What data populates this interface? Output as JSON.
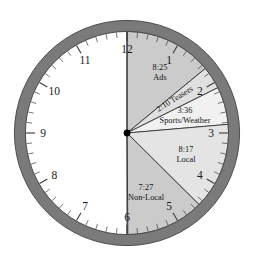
{
  "figure": {
    "name": "clock-pie-chart",
    "title": "",
    "face_background": "#ffffff",
    "bezel_color": "#7a7a7a",
    "bezel_edge_color": "#4a4a4a",
    "tick_color": "#3a3a3a",
    "line_color": "#000000",
    "hub_color": "#000000"
  },
  "clock": {
    "numerals": [
      "1",
      "2",
      "3",
      "4",
      "5",
      "6",
      "7",
      "8",
      "9",
      "10",
      "11",
      "12"
    ],
    "minute_ticks": 60,
    "center": {
      "x": 127,
      "y": 133
    },
    "radius": 113
  },
  "chart_data": {
    "type": "pie",
    "title": "",
    "subtitle": "",
    "xlabel": "",
    "ylabel": "",
    "units": "minutes:seconds",
    "total_label": "30:00",
    "total_minutes": 30,
    "start_angle_deg": 0,
    "direction": "clockwise",
    "legend": "inline-labels",
    "grid": false,
    "categories": [
      "Ads",
      "Teasers",
      "Sports/Weather",
      "Local",
      "Non-Local",
      "Unshaded"
    ],
    "values": [
      8.4167,
      2.1667,
      3.6,
      8.2833,
      7.45,
      0.0
    ],
    "slices": [
      {
        "name": "Ads",
        "time_label": "8:25",
        "label": "Ads",
        "minutes": 8.4167,
        "start_deg": 0.0,
        "end_deg": 101.0,
        "color": "#cfcfcf",
        "rotated": false
      },
      {
        "name": "Teasers",
        "time_label": "2:10",
        "label": "Teasers",
        "minutes": 2.1667,
        "start_deg": 101.0,
        "end_deg": 127.0,
        "color": "#e0e0e0",
        "rotated": true
      },
      {
        "name": "Sports/Weather",
        "time_label": "3:36",
        "label": "Sports/Weather",
        "minutes": 3.6,
        "start_deg": 127.0,
        "end_deg": 170.2,
        "color": "#efefef",
        "rotated": false
      },
      {
        "name": "Local",
        "time_label": "8:17",
        "label": "Local",
        "minutes": 8.2833,
        "start_deg": 170.2,
        "end_deg": 269.6,
        "color": "#e4e4e4",
        "rotated": false
      },
      {
        "name": "Non-Local",
        "time_label": "7:27",
        "label": "Non-Local",
        "minutes": 7.45,
        "start_deg": 269.6,
        "end_deg": 359.0,
        "color": "#cfcfcf",
        "rotated": false
      }
    ],
    "annotations": [
      {
        "text": "8:25",
        "role": "slice-time"
      },
      {
        "text": "Ads",
        "role": "slice-name"
      },
      {
        "text": "2:10 Teasers",
        "role": "slice-combined"
      },
      {
        "text": "3:36",
        "role": "slice-time"
      },
      {
        "text": "Sports/Weather",
        "role": "slice-name"
      },
      {
        "text": "8:17",
        "role": "slice-time"
      },
      {
        "text": "Local",
        "role": "slice-name"
      },
      {
        "text": "7:27",
        "role": "slice-time"
      },
      {
        "text": "Non-Local",
        "role": "slice-name"
      }
    ]
  }
}
